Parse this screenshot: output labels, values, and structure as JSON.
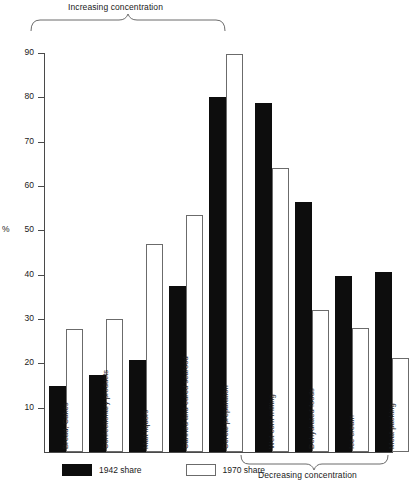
{
  "chart_data": {
    "type": "bar",
    "title": "",
    "xlabel": "",
    "ylabel": "%",
    "ylim": [
      0,
      90
    ],
    "yticks": [
      10,
      20,
      30,
      40,
      50,
      60,
      70,
      80,
      90
    ],
    "grid": false,
    "legend_position": "bottom-left",
    "categories": [
      "Bread, Cakes",
      "Confectionary products",
      "Malt liquors",
      "Canned and cured seafood",
      "Cereal preparation",
      "Wet corn milling",
      "Dehydrated foods",
      "Ice cream",
      "Meat packing"
    ],
    "series": [
      {
        "name": "1942 share",
        "color": "#0d0d0d",
        "values": [
          14.8,
          17.3,
          20.8,
          37.5,
          80.0,
          78.8,
          56.4,
          39.7,
          40.7
        ]
      },
      {
        "name": "1970 share",
        "color": "#ffffff",
        "values": [
          27.8,
          30.0,
          47.0,
          53.5,
          89.7,
          64.0,
          32.0,
          28.0,
          21.3
        ]
      }
    ],
    "annotations": [
      {
        "text": "Increasing concentration",
        "position": "top",
        "spans_categories": [
          "Bread, Cakes",
          "Cereal preparation"
        ]
      },
      {
        "text": "Decreasing concentration",
        "position": "bottom",
        "spans_categories": [
          "Wet corn milling",
          "Meat packing"
        ]
      }
    ]
  },
  "axis": {
    "y_title": "%",
    "tick_labels": [
      "90",
      "80",
      "70",
      "60",
      "50",
      "40",
      "30",
      "20",
      "10"
    ]
  },
  "brackets": {
    "top_label": "Increasing concentration",
    "bottom_label": "Decreasing concentration"
  },
  "legend": {
    "items": [
      {
        "label": "1942 share",
        "style": "black"
      },
      {
        "label": "1970 share",
        "style": "white"
      }
    ]
  }
}
